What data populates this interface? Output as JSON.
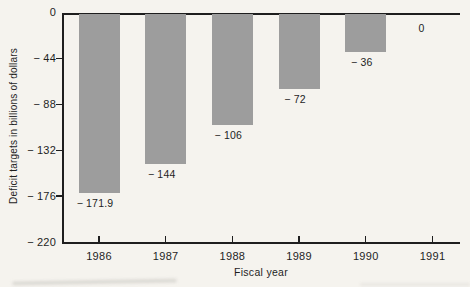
{
  "chart_data": {
    "type": "bar",
    "title": "",
    "xlabel": "Fiscal year",
    "ylabel": "Deficit targets in billions of dollars",
    "categories": [
      "1986",
      "1987",
      "1988",
      "1989",
      "1990",
      "1991"
    ],
    "values": [
      -171.9,
      -144,
      -106,
      -72,
      -36,
      0
    ],
    "value_labels": [
      "− 171.9",
      "− 144",
      "− 106",
      "− 72",
      "− 36",
      "0"
    ],
    "ylim": [
      -220,
      0
    ],
    "y_ticks": [
      0,
      -44,
      -88,
      -132,
      -176,
      -220
    ],
    "y_tick_labels": [
      "0",
      "− 44",
      "− 88",
      "− 132",
      "− 176",
      "− 220"
    ],
    "grid": false,
    "legend_position": "none",
    "bar_orientation": "vertical-negative",
    "colors": {
      "bar": "#9d9d9d",
      "axis": "#1e1e1e",
      "text": "#1e1e1e",
      "background": "#f5f3ee"
    }
  }
}
